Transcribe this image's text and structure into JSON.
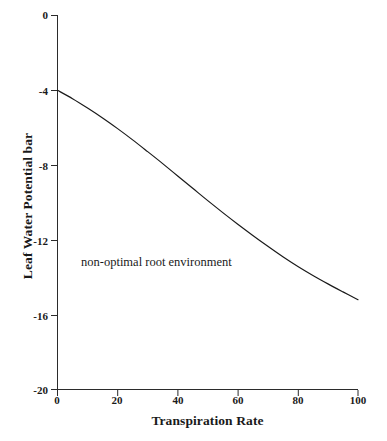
{
  "chart_data": {
    "type": "line",
    "title": "",
    "xlabel": "Transpiration Rate",
    "ylabel": "Leaf Water Potential  bar",
    "xlim": [
      0,
      100
    ],
    "ylim": [
      -20,
      0
    ],
    "xticks": [
      "0",
      "20",
      "40",
      "60",
      "80",
      "100"
    ],
    "yticks": [
      "0",
      "-4",
      "-8",
      "-12",
      "-16",
      "-20"
    ],
    "grid": false,
    "legend": false,
    "line_color": "#1a1a1a",
    "series": [
      {
        "name": "non-optimal root environment",
        "x": [
          0,
          5,
          10,
          15,
          20,
          25,
          30,
          35,
          40,
          45,
          50,
          55,
          60,
          65,
          70,
          75,
          80,
          85,
          90,
          95,
          100
        ],
        "values": [
          -4.0,
          -4.45,
          -4.95,
          -5.48,
          -6.05,
          -6.65,
          -7.28,
          -7.92,
          -8.58,
          -9.24,
          -9.9,
          -10.54,
          -11.16,
          -11.76,
          -12.34,
          -12.9,
          -13.42,
          -13.9,
          -14.35,
          -14.78,
          -15.2
        ]
      }
    ],
    "annotations": [
      {
        "text": "non-optimal root environment",
        "x": 38,
        "y": -13.0
      }
    ]
  }
}
